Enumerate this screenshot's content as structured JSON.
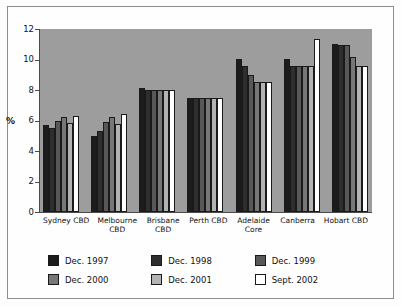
{
  "chart_data": {
    "type": "bar",
    "title": "",
    "subtitle": "",
    "xlabel": "",
    "ylabel": "%",
    "ylim": [
      0,
      12
    ],
    "yticks": [
      0,
      2,
      4,
      6,
      8,
      10,
      12
    ],
    "ytick_labels": [
      "0",
      "2",
      "4",
      "6",
      "8",
      "10",
      "12"
    ],
    "grid": false,
    "legend_position": "bottom",
    "plot_background": "#9d9d9d",
    "categories": [
      "Sydney CBD",
      "Melbourne CBD",
      "Brisbane CBD",
      "Perth CBD",
      "Adelaide Core",
      "Canberra",
      "Hobart CBD"
    ],
    "category_lines": [
      [
        "Sydney CBD"
      ],
      [
        "Melbourne",
        "CBD"
      ],
      [
        "Brisbane",
        "CBD"
      ],
      [
        "Perth CBD"
      ],
      [
        "Adelaide",
        "Core"
      ],
      [
        "Canberra"
      ],
      [
        "Hobart CBD"
      ]
    ],
    "series": [
      {
        "name": "Dec. 1997",
        "color": "#1c1c1c",
        "values": [
          5.7,
          5.0,
          8.1,
          7.5,
          10.05,
          10.05,
          11.0
        ]
      },
      {
        "name": "Dec. 1998",
        "color": "#2e2e2e",
        "values": [
          5.5,
          5.3,
          8.0,
          7.5,
          9.6,
          9.55,
          10.95
        ]
      },
      {
        "name": "Dec. 1999",
        "color": "#585858",
        "values": [
          6.0,
          5.9,
          8.0,
          7.5,
          9.0,
          9.55,
          10.95
        ]
      },
      {
        "name": "Dec. 2000",
        "color": "#777777",
        "values": [
          6.25,
          6.2,
          8.0,
          7.5,
          8.5,
          9.55,
          10.15
        ]
      },
      {
        "name": "Dec. 2001",
        "color": "#b3b3b3",
        "values": [
          5.85,
          5.8,
          8.0,
          7.5,
          8.5,
          9.55,
          9.55
        ]
      },
      {
        "name": "Sept. 2002",
        "color": "#ffffff",
        "values": [
          6.3,
          6.4,
          8.0,
          7.5,
          8.55,
          11.35,
          9.55
        ]
      }
    ]
  },
  "axis": {
    "y_label": "%",
    "y_ticks": [
      "12",
      "10",
      "8",
      "6",
      "4",
      "2",
      "0"
    ]
  },
  "legend": {
    "items": [
      {
        "label": "Dec. 1997",
        "color": "#1c1c1c"
      },
      {
        "label": "Dec. 1998",
        "color": "#2e2e2e"
      },
      {
        "label": "Dec. 1999",
        "color": "#585858"
      },
      {
        "label": "Dec. 2000",
        "color": "#777777"
      },
      {
        "label": "Dec. 2001",
        "color": "#b3b3b3"
      },
      {
        "label": "Sept. 2002",
        "color": "#ffffff"
      }
    ]
  }
}
